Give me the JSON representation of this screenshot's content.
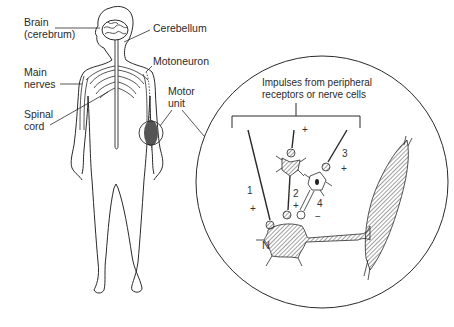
{
  "figure": {
    "type": "anatomical-diagram",
    "body_labels": {
      "brain_line1": "Brain",
      "brain_line2": "(cerebrum)",
      "cerebellum": "Cerebellum",
      "motoneuron": "Motoneuron",
      "main_nerves_line1": "Main",
      "main_nerves_line2": "nerves",
      "motor_unit_line1": "Motor",
      "motor_unit_line2": "unit",
      "spinal_cord_line1": "Spinal",
      "spinal_cord_line2": "cord"
    },
    "inset": {
      "caption_line1": "Impulses from peripheral",
      "caption_line2": "receptors or nerve cells",
      "inputs": [
        {
          "number": "1",
          "sign": "+"
        },
        {
          "number": "2",
          "sign": "+"
        },
        {
          "number": "3",
          "sign": "+"
        },
        {
          "number": "4",
          "sign": "−"
        }
      ],
      "top_sign": "+",
      "neuron_label": "N"
    },
    "colors": {
      "line": "#2a2a2a",
      "background": "#ffffff",
      "hatch": "#555555"
    }
  }
}
